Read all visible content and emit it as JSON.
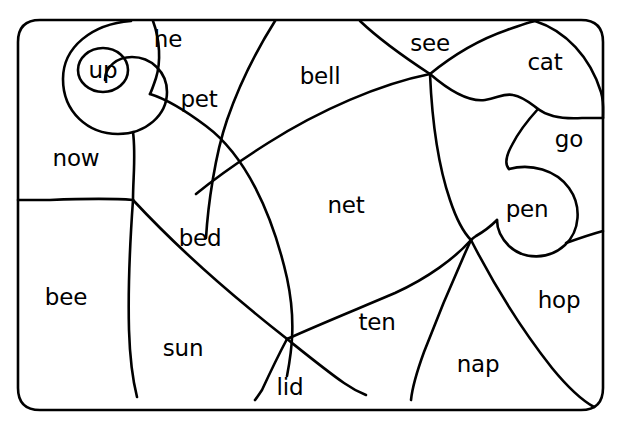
{
  "worksheet": {
    "cropped_heading": "",
    "background_color": "#ffffff",
    "ink_color": "#000000",
    "frame": {
      "name": "rounded-rectangle-border",
      "x": 18,
      "y": 20,
      "width": 585,
      "height": 390,
      "corner_radius": 22
    }
  },
  "regions": [
    {
      "id": "up",
      "label": "up",
      "x": 103,
      "y": 70,
      "circled": true
    },
    {
      "id": "he",
      "label": "he",
      "x": 168,
      "y": 39,
      "circled": false
    },
    {
      "id": "pet",
      "label": "pet",
      "x": 199,
      "y": 99,
      "circled": false
    },
    {
      "id": "bell",
      "label": "bell",
      "x": 320,
      "y": 76,
      "circled": false
    },
    {
      "id": "see",
      "label": "see",
      "x": 430,
      "y": 43,
      "circled": false
    },
    {
      "id": "cat",
      "label": "cat",
      "x": 545,
      "y": 62,
      "circled": false
    },
    {
      "id": "go",
      "label": "go",
      "x": 569,
      "y": 139,
      "circled": false
    },
    {
      "id": "now",
      "label": "now",
      "x": 76,
      "y": 158,
      "circled": false
    },
    {
      "id": "net",
      "label": "net",
      "x": 346,
      "y": 205,
      "circled": false
    },
    {
      "id": "pen",
      "label": "pen",
      "x": 527,
      "y": 209,
      "circled": false
    },
    {
      "id": "bed",
      "label": "bed",
      "x": 200,
      "y": 238,
      "circled": false
    },
    {
      "id": "bee",
      "label": "bee",
      "x": 66,
      "y": 297,
      "circled": false
    },
    {
      "id": "hop",
      "label": "hop",
      "x": 559,
      "y": 300,
      "circled": false
    },
    {
      "id": "ten",
      "label": "ten",
      "x": 377,
      "y": 322,
      "circled": false
    },
    {
      "id": "sun",
      "label": "sun",
      "x": 183,
      "y": 348,
      "circled": false
    },
    {
      "id": "nap",
      "label": "nap",
      "x": 478,
      "y": 364,
      "circled": false
    },
    {
      "id": "lid",
      "label": "lid",
      "x": 290,
      "y": 387,
      "circled": false
    }
  ],
  "circled_word_marker": {
    "name": "up-circle-highlight",
    "cx": 103,
    "cy": 70,
    "rx": 25,
    "ry": 22
  }
}
